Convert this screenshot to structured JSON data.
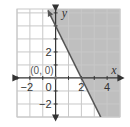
{
  "chart_data": {
    "type": "line",
    "title": "",
    "xlabel": "x",
    "ylabel": "y",
    "xlim": [
      -3,
      5
    ],
    "ylim": [
      -3,
      5.3
    ],
    "grid": true,
    "x_ticks": [
      {
        "value": -2,
        "label": "−2"
      },
      {
        "value": 2,
        "label": "2"
      },
      {
        "value": 4,
        "label": "4"
      }
    ],
    "y_ticks": [
      {
        "value": 2,
        "label": "2"
      },
      {
        "value": -2,
        "label": "−2"
      }
    ],
    "origin_label": "0",
    "series": [
      {
        "name": "boundary line",
        "equation": "y = -2x + 4",
        "slope": -2,
        "intercept": 4,
        "style": "solid",
        "x": [
          -0.6,
          4.0
        ],
        "y": [
          5.2,
          -4.0
        ]
      }
    ],
    "shaded_region": {
      "description": "half-plane to the right of / above the line",
      "inequality": "y >= -2x + 4",
      "color": "#bfbfbf"
    },
    "annotations": [
      {
        "text": "(0, 0)",
        "x": 0,
        "y": 0,
        "point": true
      }
    ],
    "colors": {
      "grid": "#c8c8c8",
      "axis": "#333333",
      "shade": "#bfbfbf",
      "line": "#555555"
    }
  }
}
